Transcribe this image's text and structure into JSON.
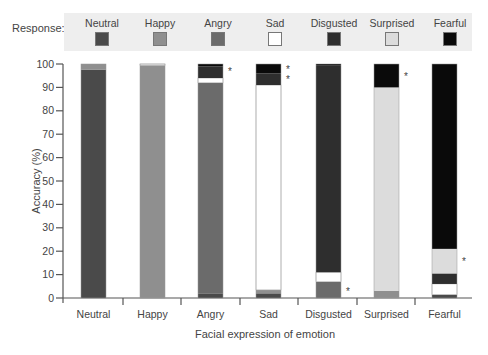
{
  "legend": {
    "title": "Response:",
    "items": [
      {
        "label": "Neutral",
        "color": "#4a4a4a"
      },
      {
        "label": "Happy",
        "color": "#8f8f8f"
      },
      {
        "label": "Angry",
        "color": "#6b6b6b"
      },
      {
        "label": "Sad",
        "color": "#ffffff"
      },
      {
        "label": "Disgusted",
        "color": "#2e2e2e"
      },
      {
        "label": "Surprised",
        "color": "#dcdcdc"
      },
      {
        "label": "Fearful",
        "color": "#0a0a0a"
      }
    ]
  },
  "chart_data": {
    "type": "bar",
    "stacked": true,
    "title": "",
    "xlabel": "Facial expression of emotion",
    "ylabel": "Accuracy (%)",
    "ylim": [
      0,
      100
    ],
    "yticks": [
      0,
      10,
      20,
      30,
      40,
      50,
      60,
      70,
      80,
      90,
      100
    ],
    "grid": false,
    "legend_position": "top",
    "categories": [
      "Neutral",
      "Happy",
      "Angry",
      "Sad",
      "Disgusted",
      "Surprised",
      "Fearful"
    ],
    "series": [
      {
        "name": "Neutral",
        "values": [
          97.5,
          0,
          2,
          2,
          0,
          0,
          1.5
        ]
      },
      {
        "name": "Happy",
        "values": [
          2.5,
          99.5,
          0,
          1.5,
          0,
          3,
          0
        ]
      },
      {
        "name": "Angry",
        "values": [
          0,
          0,
          90,
          0,
          7,
          0,
          0
        ]
      },
      {
        "name": "Sad",
        "values": [
          0,
          0.5,
          2,
          87.5,
          4,
          0,
          4.5
        ]
      },
      {
        "name": "Disgusted",
        "values": [
          0,
          0,
          5,
          5,
          88.5,
          0,
          4.5
        ]
      },
      {
        "name": "Surprised",
        "values": [
          0,
          0,
          0,
          0,
          0,
          87,
          10.5
        ]
      },
      {
        "name": "Fearful",
        "values": [
          0,
          0,
          1,
          4,
          0.5,
          10,
          79
        ]
      }
    ],
    "annotations": [
      {
        "category": "Angry",
        "text": "*",
        "at": 97
      },
      {
        "category": "Sad",
        "text": "*",
        "at": 98
      },
      {
        "category": "Sad",
        "text": "*",
        "at": 93.5
      },
      {
        "category": "Disgusted",
        "text": "*",
        "at": 3
      },
      {
        "category": "Surprised",
        "text": "*",
        "at": 95
      },
      {
        "category": "Fearful",
        "text": "*",
        "at": 16
      }
    ]
  }
}
